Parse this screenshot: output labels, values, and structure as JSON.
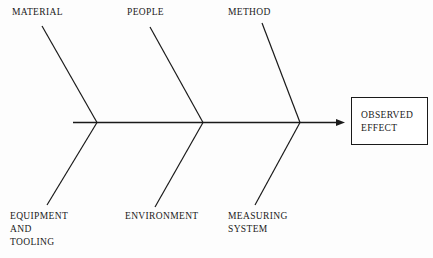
{
  "diagram": {
    "type": "fishbone-ishikawa-cause-and-effect",
    "background_color": "#fdfdfd",
    "line_color": "#1a1a1a",
    "text_color": "#1a1a1a",
    "spine": {
      "x_start": 73,
      "x_end": 345,
      "y": 122,
      "arrowhead": "solid-triangle-right"
    },
    "categories_top": [
      {
        "label": "MATERIAL",
        "label_x": 12,
        "label_y": 6,
        "bone_start_x": 42,
        "bone_start_y": 26,
        "bone_end_x": 97,
        "bone_end_y": 122
      },
      {
        "label": "PEOPLE",
        "label_x": 127,
        "label_y": 6,
        "bone_start_x": 150,
        "bone_start_y": 27,
        "bone_end_x": 203,
        "bone_end_y": 122
      },
      {
        "label": "METHOD",
        "label_x": 228,
        "label_y": 6,
        "bone_start_x": 262,
        "bone_start_y": 23,
        "bone_end_x": 300,
        "bone_end_y": 122
      }
    ],
    "categories_bottom": [
      {
        "label": "EQUIPMENT\nAND\nTOOLING",
        "label_x": 10,
        "label_y": 210,
        "bone_start_x": 97,
        "bone_start_y": 122,
        "bone_end_x": 47,
        "bone_end_y": 205
      },
      {
        "label": "ENVIRONMENT",
        "label_x": 125,
        "label_y": 210,
        "bone_start_x": 203,
        "bone_start_y": 122,
        "bone_end_x": 155,
        "bone_end_y": 207
      },
      {
        "label": "MEASURING\nSYSTEM",
        "label_x": 228,
        "label_y": 210,
        "bone_start_x": 300,
        "bone_start_y": 122,
        "bone_end_x": 255,
        "bone_end_y": 205
      }
    ],
    "effect": {
      "label": "OBSERVED\nEFFECT",
      "box_x": 351,
      "box_y": 97,
      "box_width": 77,
      "box_height": 48
    }
  }
}
